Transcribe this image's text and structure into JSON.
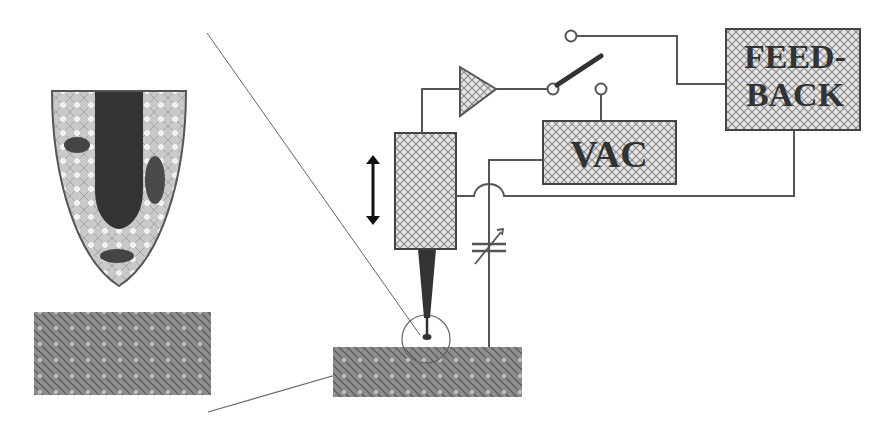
{
  "diagram": {
    "type": "scanning-probe-microscope-schematic",
    "labels": {
      "vac": "VAC",
      "feedback_line1": "FEED-",
      "feedback_line2": "BACK"
    },
    "components": [
      {
        "name": "tip-magnified-view",
        "description": "enlarged parabolic tip with dark inclusions"
      },
      {
        "name": "sample-magnified",
        "description": "hatched sample block below enlarged tip"
      },
      {
        "name": "piezo-actuator",
        "description": "cross-hatched vertical block"
      },
      {
        "name": "vertical-motion-arrow",
        "description": "double-headed arrow"
      },
      {
        "name": "probe-tip",
        "description": "dark tapered tip"
      },
      {
        "name": "amplifier",
        "description": "triangle amplifier"
      },
      {
        "name": "switch",
        "description": "toggle switch with contacts"
      },
      {
        "name": "vac-box",
        "description": "AC voltage source"
      },
      {
        "name": "feedback-box",
        "description": "feedback controller"
      },
      {
        "name": "variable-capacitor",
        "description": "tunable capacitor"
      },
      {
        "name": "sample-substrate",
        "description": "hatched substrate"
      },
      {
        "name": "magnifier-circle",
        "description": "circle around tip-sample junction"
      }
    ],
    "colors": {
      "line": "#444444",
      "dark_fill": "#2a2a2a",
      "medium_fill": "#555555",
      "hatch_light": "#d8d8d8",
      "hatch_dark": "#777777",
      "text": "#333333"
    }
  }
}
